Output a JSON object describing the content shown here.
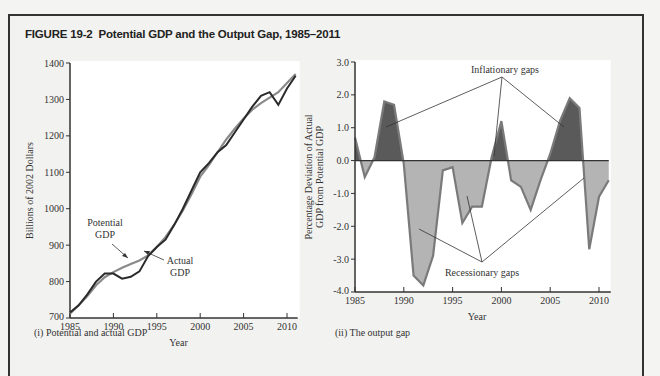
{
  "figure": {
    "number": "FIGURE 19-2",
    "title": "Potential GDP and the Output Gap, 1985–2011"
  },
  "captions": {
    "left": "(i) Potential and actual GDP",
    "right": "(ii) The output gap"
  },
  "colors": {
    "actual_line": "#2a2a2a",
    "potential_line": "#8a8a8a",
    "inflationary_fill": "#5a5a5a",
    "recessionary_fill": "#b4b4b4",
    "gap_outline": "#7a7a7a",
    "plot_bg": "#ffffff",
    "frame_bg": "#f2f2f0"
  },
  "chart_data": [
    {
      "type": "line",
      "title": "(i) Potential and actual GDP",
      "xlabel": "Year",
      "ylabel": "Billions of 2002 Dollars",
      "xlim": [
        1985,
        2011
      ],
      "ylim": [
        700,
        1400
      ],
      "xticks": [
        1985,
        1990,
        1995,
        2000,
        2005,
        2010
      ],
      "yticks": [
        700,
        800,
        900,
        1000,
        1100,
        1200,
        1300,
        1400
      ],
      "grid": false,
      "x": [
        1985,
        1986,
        1987,
        1988,
        1989,
        1990,
        1991,
        1992,
        1993,
        1994,
        1995,
        1996,
        1997,
        1998,
        1999,
        2000,
        2001,
        2002,
        2003,
        2004,
        2005,
        2006,
        2007,
        2008,
        2009,
        2010,
        2011
      ],
      "series": [
        {
          "name": "Actual GDP",
          "values": [
            715,
            735,
            765,
            800,
            822,
            822,
            808,
            813,
            828,
            870,
            895,
            915,
            955,
            1000,
            1050,
            1100,
            1125,
            1155,
            1175,
            1210,
            1245,
            1280,
            1310,
            1320,
            1285,
            1330,
            1365
          ]
        },
        {
          "name": "Potential GDP",
          "values": [
            712,
            735,
            760,
            790,
            812,
            826,
            838,
            848,
            858,
            872,
            895,
            922,
            956,
            995,
            1040,
            1088,
            1120,
            1155,
            1190,
            1220,
            1248,
            1272,
            1290,
            1305,
            1320,
            1345,
            1370
          ]
        }
      ],
      "annotations": [
        {
          "text": "Potential GDP",
          "points_to": "Potential GDP line near 1992"
        },
        {
          "text": "Actual GDP",
          "points_to": "Actual GDP line near 1993"
        }
      ]
    },
    {
      "type": "area",
      "title": "(ii) The output gap",
      "xlabel": "Year",
      "ylabel": "Percentage Deviation of Actual GDP from Potential GDP",
      "xlim": [
        1985,
        2011
      ],
      "ylim": [
        -4.0,
        3.0
      ],
      "xticks": [
        1985,
        1990,
        1995,
        2000,
        2005,
        2010
      ],
      "yticks": [
        "-4.0",
        "-3.0",
        "-2.0",
        "-1.0",
        "0.0",
        "1.0",
        "2.0",
        "3.0"
      ],
      "grid": false,
      "x": [
        1985,
        1986,
        1987,
        1988,
        1989,
        1990,
        1991,
        1992,
        1993,
        1994,
        1995,
        1996,
        1997,
        1998,
        1999,
        2000,
        2001,
        2002,
        2003,
        2004,
        2005,
        2006,
        2007,
        2008,
        2009,
        2010,
        2011
      ],
      "series": [
        {
          "name": "Output gap",
          "values": [
            0.7,
            -0.5,
            0.1,
            1.8,
            1.7,
            -0.1,
            -3.5,
            -3.8,
            -2.9,
            -0.3,
            -0.2,
            -1.9,
            -1.4,
            -1.4,
            0.1,
            1.2,
            -0.6,
            -0.8,
            -1.5,
            -0.6,
            0.2,
            1.2,
            1.9,
            1.6,
            -2.7,
            -1.1,
            -0.6
          ]
        }
      ],
      "annotations": [
        {
          "text": "Inflationary gaps",
          "points_to": [
            "1988",
            "2000",
            "2007"
          ]
        },
        {
          "text": "Recessionary gaps",
          "points_to": [
            "1992",
            "1997",
            "2009"
          ]
        }
      ]
    }
  ]
}
